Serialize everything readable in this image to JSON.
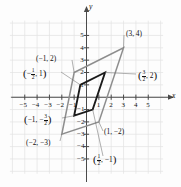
{
  "figure": {
    "kind": "coordinate-plane-parallelograms",
    "axis_labels": {
      "x": "x",
      "y": "y"
    },
    "x_ticks": [
      "-5",
      "-4",
      "-3",
      "-2",
      "-1",
      "1",
      "2",
      "3",
      "4",
      "5"
    ],
    "y_ticks": [
      "5",
      "4",
      "3",
      "2",
      "1",
      "-1",
      "-2",
      "-3",
      "-4",
      "-5"
    ],
    "colors": {
      "grid": "#e2e2e2",
      "axis": "#4a4a4a",
      "outer": "#8e8e8e",
      "inner": "#1a1a1a",
      "text": "#111111"
    }
  },
  "chart_data": {
    "type": "scatter",
    "title": "",
    "xlabel": "x",
    "ylabel": "y",
    "xlim": [
      -6,
      6
    ],
    "ylim": [
      -6,
      6
    ],
    "grid": true,
    "legend": "none",
    "series": [
      {
        "name": "outer-parallelogram",
        "color": "#8e8e8e",
        "closed": true,
        "points": [
          {
            "x": -1,
            "y": 2,
            "label": "(−1, 2)"
          },
          {
            "x": 3,
            "y": 4,
            "label": "(3, 4)"
          },
          {
            "x": 1,
            "y": -2,
            "label": "(1, −2)"
          },
          {
            "x": -2,
            "y": -3,
            "label": "(−2, −3)"
          }
        ]
      },
      {
        "name": "inner-parallelogram",
        "color": "#1a1a1a",
        "closed": true,
        "points": [
          {
            "x": -0.5,
            "y": 1,
            "label": "(−½, 1)"
          },
          {
            "x": 1.5,
            "y": 2,
            "label": "(3/2, 2)"
          },
          {
            "x": 0.5,
            "y": -1,
            "label": "(½, −1)"
          },
          {
            "x": -1,
            "y": -1.5,
            "label": "(−1, −3/2)"
          }
        ]
      }
    ],
    "annotations": [
      {
        "id": "a-neg1-2",
        "text": "(−1, 2)",
        "x": -1,
        "y": 2
      },
      {
        "id": "a-3-4",
        "text": "(3, 4)",
        "x": 3,
        "y": 4
      },
      {
        "id": "a-neghalf-1",
        "text": "(−½, 1)",
        "x": -0.5,
        "y": 1
      },
      {
        "id": "a-3over2-2",
        "text": "(3/2, 2)",
        "x": 1.5,
        "y": 2
      },
      {
        "id": "a-neg1-neg3o2",
        "text": "(−1, −3/2)",
        "x": -1,
        "y": -1.5
      },
      {
        "id": "a-neg2-neg3",
        "text": "(−2, −3)",
        "x": -2,
        "y": -3
      },
      {
        "id": "a-1-neg2",
        "text": "(1, −2)",
        "x": 1,
        "y": -2
      },
      {
        "id": "a-half-neg1",
        "text": "(½, −1)",
        "x": 0.5,
        "y": -1
      }
    ]
  },
  "labels": {
    "neg1_2": "(−1, 2)",
    "p3_4": "(3, 4)",
    "neg2_3": "(−2, −3)",
    "p1_neg2": "(1, −2)",
    "x_axis": "x",
    "y_axis": "y",
    "frac_neghalf_1": {
      "open": "(",
      "minus": "−",
      "num": "1",
      "den": "2",
      "rest": ", 1",
      "close": ")"
    },
    "frac_3over2_2": {
      "open": "(",
      "num": "3",
      "den": "2",
      "rest": ", 2",
      "close": ")"
    },
    "frac_neg1_neg3over2": {
      "open": "(",
      "lead": "−1, −",
      "num": "3",
      "den": "2",
      "close": ")"
    },
    "frac_half_neg1": {
      "open": "(",
      "num": "1",
      "den": "2",
      "rest": ", −1",
      "close": ")"
    }
  },
  "ticks": {
    "x": [
      {
        "t": "−5",
        "v": -5
      },
      {
        "t": "−4",
        "v": -4
      },
      {
        "t": "−3",
        "v": -3
      },
      {
        "t": "−2",
        "v": -2
      },
      {
        "t": "−1",
        "v": -1
      },
      {
        "t": "1",
        "v": 1
      },
      {
        "t": "2",
        "v": 2
      },
      {
        "t": "3",
        "v": 3
      },
      {
        "t": "4",
        "v": 4
      },
      {
        "t": "5",
        "v": 5
      }
    ],
    "y": [
      {
        "t": "5",
        "v": 5
      },
      {
        "t": "4",
        "v": 4
      },
      {
        "t": "3",
        "v": 3
      },
      {
        "t": "2",
        "v": 2
      },
      {
        "t": "1",
        "v": 1
      },
      {
        "t": "−1",
        "v": -1
      },
      {
        "t": "−2",
        "v": -2
      },
      {
        "t": "−3",
        "v": -3
      },
      {
        "t": "−4",
        "v": -4
      },
      {
        "t": "−5",
        "v": -5
      }
    ]
  }
}
